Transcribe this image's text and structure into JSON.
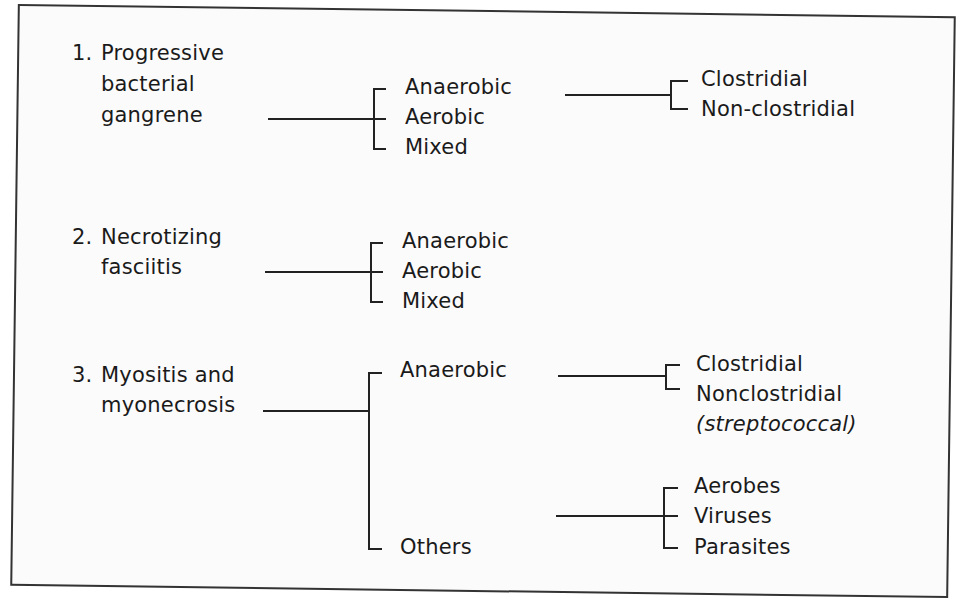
{
  "diagram": {
    "type": "classification-tree",
    "groups": [
      {
        "number": "1.",
        "title_lines": [
          "Progressive",
          "bacterial",
          "gangrene"
        ],
        "children": [
          {
            "label": "Anaerobic",
            "children": [
              "Clostridial",
              "Non-clostridial"
            ]
          },
          {
            "label": "Aerobic"
          },
          {
            "label": "Mixed"
          }
        ]
      },
      {
        "number": "2.",
        "title_lines": [
          "Necrotizing",
          "fasciitis"
        ],
        "children": [
          {
            "label": "Anaerobic"
          },
          {
            "label": "Aerobic"
          },
          {
            "label": "Mixed"
          }
        ]
      },
      {
        "number": "3.",
        "title_lines": [
          "Myositis and",
          "myonecrosis"
        ],
        "children": [
          {
            "label": "Anaerobic",
            "children": [
              "Clostridial",
              "Nonclostridial",
              "(streptococcal)"
            ]
          },
          {
            "label": "Others",
            "children": [
              "Aerobes",
              "Viruses",
              "Parasites"
            ]
          }
        ]
      }
    ],
    "colors": {
      "line": "#222222",
      "text": "#1a1a1a",
      "border": "#333333",
      "background": "#fbfbfb"
    }
  }
}
